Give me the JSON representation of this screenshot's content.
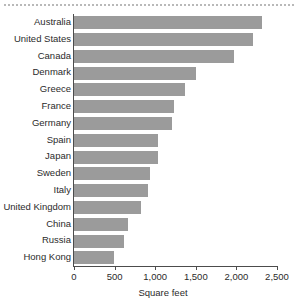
{
  "chart_data": {
    "type": "bar",
    "orientation": "horizontal",
    "title": "",
    "subtitle": "",
    "xlabel": "Square feet",
    "ylabel": "",
    "xlim": [
      0,
      2500
    ],
    "xticks": [
      0,
      500,
      1000,
      1500,
      2000,
      2500
    ],
    "xtick_labels": [
      "0",
      "500",
      "1,000",
      "1,500",
      "2,000",
      "2,500"
    ],
    "grid": false,
    "legend": null,
    "bar_color": "#9b9b9b",
    "axis_color": "#4c4c4c",
    "rule_color": "#b9b9b9",
    "categories": [
      "Australia",
      "United States",
      "Canada",
      "Denmark",
      "Greece",
      "France",
      "Germany",
      "Spain",
      "Japan",
      "Sweden",
      "Italy",
      "United Kingdom",
      "China",
      "Russia",
      "Hong Kong"
    ],
    "values": [
      2320,
      2200,
      1970,
      1500,
      1370,
      1230,
      1210,
      1040,
      1030,
      930,
      910,
      830,
      670,
      620,
      490
    ]
  }
}
